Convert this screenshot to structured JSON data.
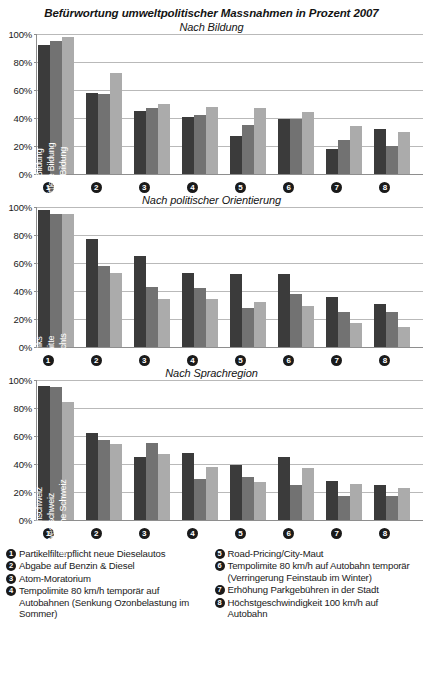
{
  "title": "Befürwortung umweltpolitischer Massnahmen in Prozent 2007",
  "y_ticks": [
    "100%",
    "80%",
    "60%",
    "40%",
    "20%",
    "0%"
  ],
  "x_badges": [
    "❶",
    "❷",
    "❸",
    "❹",
    "❺",
    "❻",
    "❼",
    "❽"
  ],
  "colors": {
    "series0": "#3b3b3b",
    "series1": "#727272",
    "series2": "#ababab",
    "gridline": "#b9b9b9",
    "axis": "#8e8e8e",
    "background": "#ffffff"
  },
  "charts": [
    {
      "subtitle": "Nach Bildung",
      "legend": [
        "tiefe Bildung",
        "mittlere Bildung",
        "hohe Bildung"
      ]
    },
    {
      "subtitle": "Nach politischer Orientierung",
      "legend": [
        "links",
        "mitte",
        "rechts"
      ]
    },
    {
      "subtitle": "Nach Sprachregion",
      "legend": [
        "Deutschschweiz",
        "Westschweiz",
        "Italienische Schweiz"
      ]
    }
  ],
  "footnotes": {
    "left": [
      {
        "num": "❶",
        "text": "Partikelfilterpflicht neue Dieselautos"
      },
      {
        "num": "❷",
        "text": "Abgabe auf Benzin & Diesel"
      },
      {
        "num": "❸",
        "text": "Atom-Moratorium"
      },
      {
        "num": "❹",
        "text": "Tempolimite 80 km/h temporär auf Autobahnen (Senkung Ozonbelastung im Sommer)"
      }
    ],
    "right": [
      {
        "num": "❺",
        "text": "Road-Pricing/City-Maut"
      },
      {
        "num": "❻",
        "text": "Tempolimite 80 km/h auf Autobahn temporär (Verringerung Feinstaub im Winter)"
      },
      {
        "num": "❼",
        "text": "Erhöhung Parkgebühren in der Stadt"
      },
      {
        "num": "❽",
        "text": "Höchstgeschwindigkeit 100 km/h auf Autobahn"
      }
    ]
  },
  "chart_data": [
    {
      "type": "bar",
      "title": "Nach Bildung",
      "xlabel": "",
      "ylabel": "Prozent",
      "ylim": [
        0,
        100
      ],
      "yticks": [
        0,
        20,
        40,
        60,
        80,
        100
      ],
      "grid": true,
      "legend_position": "in-first-group-vertical",
      "categories": [
        "❶",
        "❷",
        "❸",
        "❹",
        "❺",
        "❻",
        "❼",
        "❽"
      ],
      "series": [
        {
          "name": "tiefe Bildung",
          "values": [
            92,
            58,
            45,
            41,
            27,
            39,
            18,
            32
          ]
        },
        {
          "name": "mittlere Bildung",
          "values": [
            95,
            57,
            47,
            42,
            35,
            39,
            24,
            20
          ]
        },
        {
          "name": "hohe Bildung",
          "values": [
            98,
            72,
            50,
            48,
            47,
            44,
            34,
            30
          ]
        }
      ]
    },
    {
      "type": "bar",
      "title": "Nach politischer Orientierung",
      "xlabel": "",
      "ylabel": "Prozent",
      "ylim": [
        0,
        100
      ],
      "yticks": [
        0,
        20,
        40,
        60,
        80,
        100
      ],
      "grid": true,
      "legend_position": "in-first-group-vertical",
      "categories": [
        "❶",
        "❷",
        "❸",
        "❹",
        "❺",
        "❻",
        "❼",
        "❽"
      ],
      "series": [
        {
          "name": "links",
          "values": [
            98,
            77,
            65,
            53,
            52,
            52,
            36,
            31
          ]
        },
        {
          "name": "mitte",
          "values": [
            95,
            58,
            43,
            42,
            28,
            38,
            25,
            25
          ]
        },
        {
          "name": "rechts",
          "values": [
            95,
            53,
            34,
            34,
            32,
            29,
            17,
            14
          ]
        }
      ]
    },
    {
      "type": "bar",
      "title": "Nach Sprachregion",
      "xlabel": "",
      "ylabel": "Prozent",
      "ylim": [
        0,
        100
      ],
      "yticks": [
        0,
        20,
        40,
        60,
        80,
        100
      ],
      "grid": true,
      "legend_position": "in-first-group-vertical",
      "categories": [
        "❶",
        "❷",
        "❸",
        "❹",
        "❺",
        "❻",
        "❼",
        "❽"
      ],
      "series": [
        {
          "name": "Deutschschweiz",
          "values": [
            96,
            62,
            45,
            48,
            39,
            45,
            28,
            25
          ]
        },
        {
          "name": "Westschweiz",
          "values": [
            95,
            57,
            55,
            29,
            31,
            25,
            17,
            17
          ]
        },
        {
          "name": "Italienische Schweiz",
          "values": [
            84,
            54,
            47,
            38,
            27,
            37,
            26,
            23
          ]
        }
      ]
    }
  ]
}
